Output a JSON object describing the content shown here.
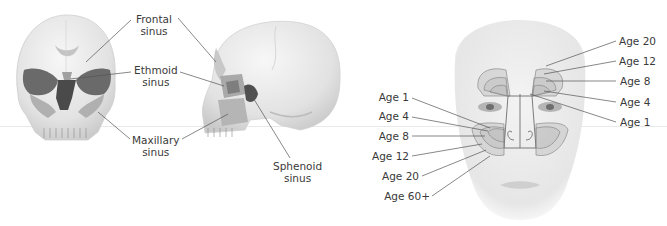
{
  "figure": {
    "panels": [
      {
        "id": "frontal-skull",
        "description": "Anterior view of skull"
      },
      {
        "id": "lateral-skull",
        "description": "Lateral view of skull"
      },
      {
        "id": "face-development",
        "description": "Frontal view of face with sinus development by age"
      }
    ],
    "sinus_labels": {
      "frontal": [
        "Frontal",
        "sinus"
      ],
      "ethmoid": [
        "Ethmoid",
        "sinus"
      ],
      "maxillary": [
        "Maxillary",
        "sinus"
      ],
      "sphenoid": [
        "Sphenoid",
        "sinus"
      ]
    },
    "frontal_sinus_ages": [
      "Age 20",
      "Age 12",
      "Age 8",
      "Age 4",
      "Age 1"
    ],
    "maxillary_sinus_ages": [
      "Age 1",
      "Age 4",
      "Age 8",
      "Age 12",
      "Age 20",
      "Age 60+"
    ],
    "colors": {
      "bone": "#e4e4e4",
      "bone_shadow": "#bdbdbd",
      "cavity": "#5e5e5e",
      "sinus_fill": "#a8a8a8",
      "leader": "#555555",
      "text": "#3a3a3a"
    }
  }
}
